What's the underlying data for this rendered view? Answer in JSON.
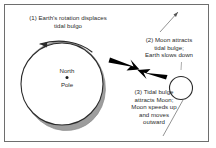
{
  "figure": {
    "background_color": "#ffffff",
    "border_color": "#6e6e6e",
    "text_color": "#2b2b2b",
    "bulge_color": "#9a9a9a",
    "arrow_color": "#000000"
  },
  "annotations": {
    "one": {
      "number": "(1)",
      "text": "(1) Earth's rotation displaces\ntidal bulgo"
    },
    "two": {
      "number": "(2)",
      "text": "(2) Moon attracts\ntidal bulge;\nEarth slows down"
    },
    "three": {
      "number": "(3)",
      "text": "(3) Tidal bulge\nattracts Moon;\nMoon speeds up\nand moves\noutward"
    }
  },
  "earth": {
    "north_label": "North",
    "pole_label": "Pole",
    "center_dot": "pole-dot"
  },
  "moon": {
    "label": "moon-circle"
  },
  "icons": {
    "rotation_arrow": "curved-rotation-arrow",
    "force_arrow_to_moon": "bold-arrow-right",
    "force_arrow_to_earth": "bold-arrow-left",
    "leader_line_upper": "leader-line",
    "leader_line_lower": "leader-line"
  }
}
